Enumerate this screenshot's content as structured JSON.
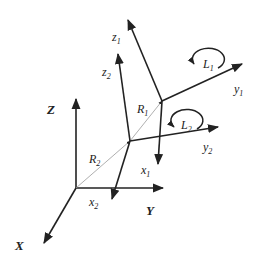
{
  "diagram": {
    "colors": {
      "ink": "#222222",
      "vector_line": "#9a9a9a"
    },
    "global_axes": {
      "x": "X",
      "y": "Y",
      "z": "Z"
    },
    "frame1": {
      "x": "x",
      "y": "y",
      "z": "z",
      "sub": "1"
    },
    "frame2": {
      "x": "x",
      "y": "y",
      "z": "z",
      "sub": "2"
    },
    "vectors": {
      "R1": {
        "base": "R",
        "sub": "1"
      },
      "R2": {
        "base": "R",
        "sub": "2"
      }
    },
    "rotations": {
      "L1": {
        "base": "L",
        "sub": "1"
      },
      "L2": {
        "base": "L",
        "sub": "2"
      }
    }
  }
}
